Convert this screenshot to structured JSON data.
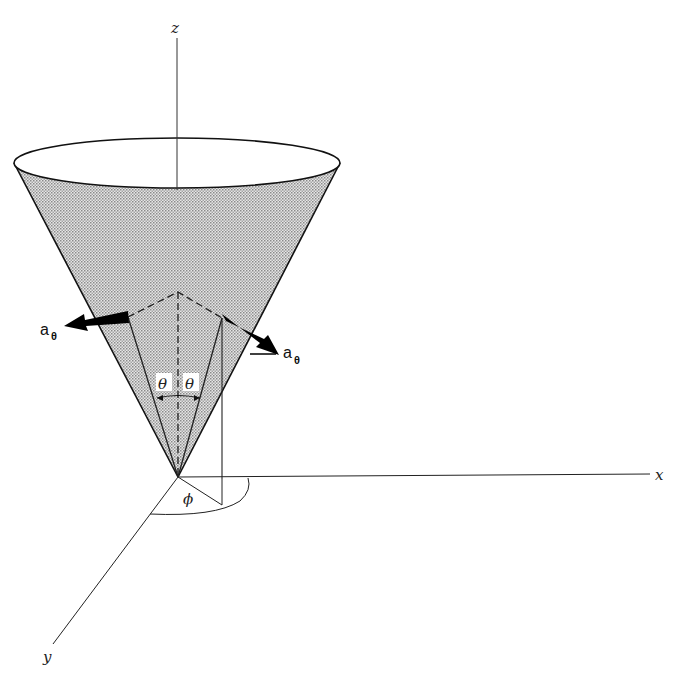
{
  "figure": {
    "type": "3D coordinate diagram",
    "axes": {
      "z": {
        "label": "z"
      },
      "x": {
        "label": "x"
      },
      "y": {
        "label": "y"
      }
    },
    "vectors": [
      {
        "id": "a-theta-left",
        "label": "a",
        "subscript": "θ"
      },
      {
        "id": "a-theta-right",
        "label": "a",
        "subscript": "θ"
      }
    ],
    "angles": {
      "theta_left": "θ",
      "theta_right": "θ",
      "phi": "ϕ"
    },
    "colors": {
      "line": "#111111",
      "cone_fill": "#bdbdbd",
      "background": "#ffffff"
    }
  }
}
